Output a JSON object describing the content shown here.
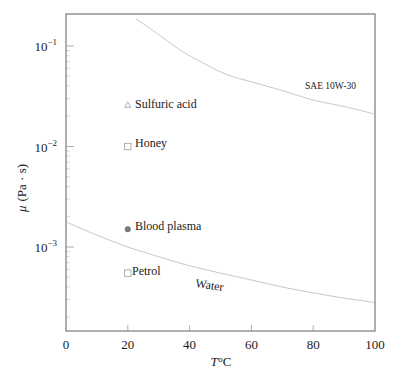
{
  "chart_data": {
    "type": "line",
    "title": "",
    "xlabel": "T°C",
    "xlabel_var": "T",
    "xlabel_unit": "°C",
    "ylabel": "μ (Pa · s)",
    "ylabel_var": "μ",
    "ylabel_unit": "(Pa · s)",
    "xlim": [
      0,
      100
    ],
    "ylim": [
      0.00022,
      0.21
    ],
    "yscale": "log",
    "grid": false,
    "legend": "none (inline annotations)",
    "x_ticks": [
      {
        "value": 0,
        "label": "0"
      },
      {
        "value": 20,
        "label": "20"
      },
      {
        "value": 40,
        "label": "40"
      },
      {
        "value": 60,
        "label": "60"
      },
      {
        "value": 80,
        "label": "80"
      },
      {
        "value": 100,
        "label": "100"
      }
    ],
    "y_ticks": [
      {
        "value": 0.1,
        "base": "10",
        "exp": "−1"
      },
      {
        "value": 0.01,
        "base": "10",
        "exp": "−2"
      },
      {
        "value": 0.001,
        "base": "10",
        "exp": "−3"
      }
    ],
    "series": [
      {
        "name": "SAE 10W-30",
        "kind": "curve",
        "label": "SAE 10W-30",
        "x": [
          22.7,
          30,
          37,
          45,
          52,
          60,
          70,
          80,
          90,
          100
        ],
        "y": [
          0.186,
          0.13,
          0.091,
          0.066,
          0.052,
          0.044,
          0.036,
          0.029,
          0.025,
          0.021
        ],
        "color": "#c4c4c4"
      },
      {
        "name": "Water",
        "kind": "curve",
        "label": "Water",
        "x": [
          0,
          10,
          20,
          30,
          40,
          50,
          60,
          70,
          80,
          90,
          100
        ],
        "y": [
          0.00178,
          0.00131,
          0.001,
          0.0008,
          0.00065,
          0.00055,
          0.00047,
          0.0004,
          0.00035,
          0.00031,
          0.00028
        ],
        "color": "#c4c4c4"
      },
      {
        "name": "Sulfuric acid",
        "kind": "point",
        "marker": "triangle",
        "label": "Sulfuric acid",
        "x": [
          20
        ],
        "y": [
          0.026
        ],
        "color": "#9a9a9a"
      },
      {
        "name": "Honey",
        "kind": "point",
        "marker": "square",
        "label": "Honey",
        "x": [
          20
        ],
        "y": [
          0.01
        ],
        "color": "#9a9a9a"
      },
      {
        "name": "Blood plasma",
        "kind": "point",
        "marker": "filled-circle",
        "label": "Blood plasma",
        "x": [
          20
        ],
        "y": [
          0.0015
        ],
        "color": "#7a7a7a"
      },
      {
        "name": "Petrol",
        "kind": "point",
        "marker": "square",
        "label": "Petrol",
        "x": [
          20
        ],
        "y": [
          0.00055
        ],
        "color": "#9a9a9a"
      }
    ]
  },
  "style": {
    "frame_color": "#7a7a7a",
    "curve_color": "#c8c8c8",
    "text_color": "#222222"
  }
}
